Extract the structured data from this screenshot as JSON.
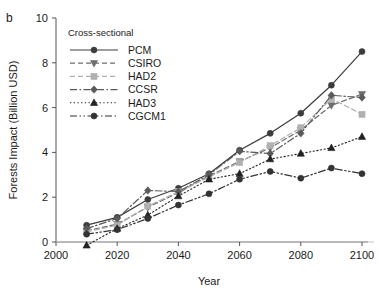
{
  "panel": {
    "label": "b"
  },
  "chart_data": {
    "type": "line",
    "title": "",
    "xlabel": "Year",
    "ylabel": "Forests Impact (Billion USD)",
    "xlim": [
      2000,
      2100
    ],
    "ylim": [
      0,
      10
    ],
    "xticks": [
      2000,
      2020,
      2040,
      2060,
      2080,
      2100
    ],
    "xtick_labels": [
      "2000",
      "2020",
      "2040",
      "2060",
      "2080",
      "2100"
    ],
    "yticks": [
      0,
      2,
      4,
      6,
      8,
      10
    ],
    "ytick_labels": [
      "0",
      "2",
      "4",
      "6",
      "8",
      "10"
    ],
    "grid": false,
    "zero_line": true,
    "legend_position": "upper-left-inside",
    "legend_title": "Cross-sectional",
    "x": [
      2010,
      2020,
      2030,
      2040,
      2050,
      2060,
      2070,
      2080,
      2090,
      2100
    ],
    "series": [
      {
        "name": "PCM",
        "color": "#3c3c3c",
        "marker": "circle",
        "dash": "solid",
        "values": [
          0.75,
          1.1,
          1.9,
          2.4,
          3.05,
          4.1,
          4.85,
          5.75,
          7.0,
          8.5
        ]
      },
      {
        "name": "CSIRO",
        "color": "#6e6e6e",
        "marker": "triangle-down",
        "dash": "dashed",
        "values": [
          0.5,
          0.8,
          1.55,
          2.2,
          2.95,
          3.6,
          4.2,
          5.0,
          6.1,
          6.6
        ]
      },
      {
        "name": "HAD2",
        "color": "#b0b0b0",
        "marker": "square",
        "dash": "dashed-light",
        "values": [
          0.45,
          0.75,
          1.6,
          2.25,
          2.9,
          3.55,
          4.3,
          5.1,
          6.4,
          5.7
        ]
      },
      {
        "name": "CCSR",
        "color": "#5a5a5a",
        "marker": "diamond",
        "dash": "dash-dot",
        "values": [
          0.6,
          1.05,
          2.3,
          2.25,
          3.0,
          4.05,
          3.95,
          4.85,
          6.55,
          6.45
        ]
      },
      {
        "name": "HAD3",
        "color": "#222222",
        "marker": "triangle-up",
        "dash": "dotted",
        "values": [
          -0.15,
          0.6,
          1.2,
          2.05,
          2.8,
          3.05,
          3.7,
          3.95,
          4.2,
          4.7
        ]
      },
      {
        "name": "CGCM1",
        "color": "#333333",
        "marker": "circle",
        "dash": "dash-dot-dot",
        "values": [
          0.35,
          0.55,
          1.05,
          1.65,
          2.15,
          2.8,
          3.15,
          2.85,
          3.3,
          3.05
        ]
      }
    ]
  }
}
